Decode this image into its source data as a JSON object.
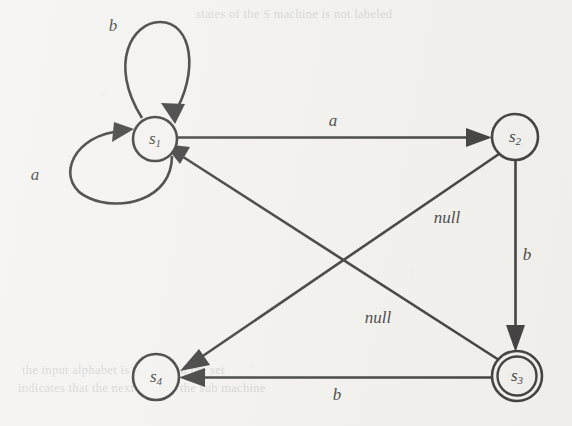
{
  "figure": {
    "kind": "finite-state-machine",
    "background_color": "#f2f1ee",
    "ink_color": "#141414",
    "width": 572,
    "height": 426
  },
  "nodes": [
    {
      "id": "s1",
      "base": "s",
      "sub": "1",
      "cx": 155,
      "cy": 139,
      "r": 22,
      "accepting": false
    },
    {
      "id": "s2",
      "base": "s",
      "sub": "2",
      "cx": 515,
      "cy": 137,
      "r": 23,
      "accepting": false
    },
    {
      "id": "s3",
      "base": "s",
      "sub": "3",
      "cx": 517,
      "cy": 376,
      "r": 25,
      "accepting": true
    },
    {
      "id": "s4",
      "base": "s",
      "sub": "4",
      "cx": 156,
      "cy": 377,
      "r": 23,
      "accepting": false
    }
  ],
  "edges": [
    {
      "id": "e-b-loop",
      "from": "s1",
      "to": "s1",
      "label": "b",
      "label_x": 113,
      "label_y": 27,
      "kind": "self-loop-top"
    },
    {
      "id": "e-a-loop",
      "from": "s1",
      "to": "s1",
      "label": "a",
      "label_x": 35,
      "label_y": 176,
      "kind": "self-loop-left"
    },
    {
      "id": "e-s1-s2",
      "from": "s1",
      "to": "s2",
      "label": "a",
      "label_x": 333,
      "label_y": 122,
      "kind": "straight"
    },
    {
      "id": "e-s2-s3",
      "from": "s2",
      "to": "s3",
      "label": "b",
      "label_x": 527,
      "label_y": 256,
      "kind": "straight"
    },
    {
      "id": "e-s3-s4",
      "from": "s3",
      "to": "s4",
      "label": "b",
      "label_x": 337,
      "label_y": 396,
      "kind": "straight"
    },
    {
      "id": "e-s2-s4",
      "from": "s2",
      "to": "s4",
      "label": "null",
      "label_x": 447,
      "label_y": 219,
      "kind": "diagonal"
    },
    {
      "id": "e-s3-s1",
      "from": "s3",
      "to": "s1",
      "label": "null",
      "label_x": 378,
      "label_y": 319,
      "kind": "diagonal"
    }
  ],
  "ghost_lines": [
    {
      "text": "states of the S machine is not labeled",
      "x": 196,
      "y": 7,
      "size": 12.5
    },
    {
      "text": "the input alphabet is {a, b} and the set",
      "x": 22,
      "y": 363,
      "size": 12.5
    },
    {
      "text": "indicates that the next state of the sub machine",
      "x": 18,
      "y": 381,
      "size": 12.5
    }
  ]
}
